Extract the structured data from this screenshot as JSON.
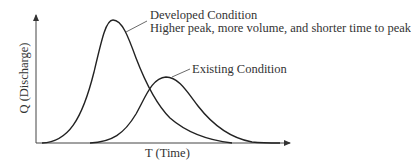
{
  "diagram": {
    "type": "hydrograph-comparison",
    "x_axis": {
      "label": "T (Time)"
    },
    "y_axis": {
      "label": "Q (Discharge)"
    },
    "curves": [
      {
        "name": "developed",
        "label": "Developed Condition",
        "description": "Higher peak, more volume, and shorter time to peak",
        "color": "#222222"
      },
      {
        "name": "existing",
        "label": "Existing Condition",
        "color": "#222222"
      }
    ]
  }
}
